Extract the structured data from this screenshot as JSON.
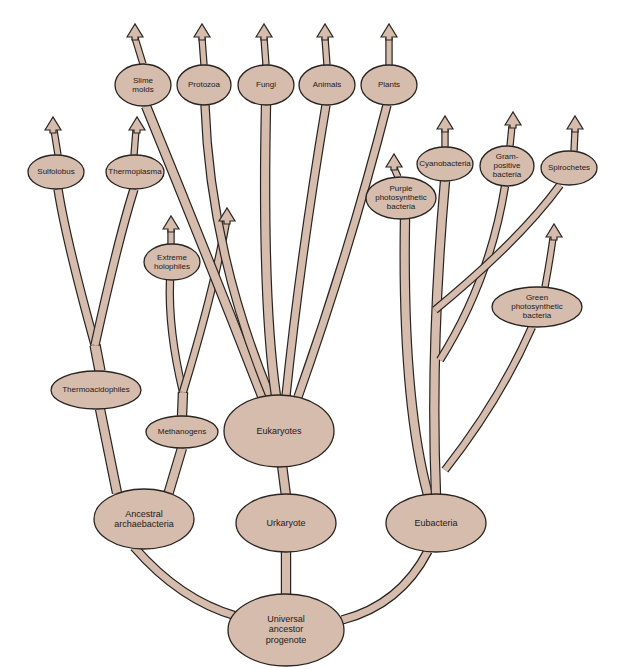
{
  "diagram": {
    "type": "phylogenetic-tree",
    "colors": {
      "fill": "#d6bcad",
      "stroke": "#2a2420",
      "background": "#ffffff"
    },
    "nodes": [
      {
        "id": "universal",
        "label": "Universal\nancestor\nprogenote",
        "x": 286,
        "y": 630,
        "rx": 58,
        "ry": 36,
        "fs": 9
      },
      {
        "id": "ancestral-archaebacteria",
        "label": "Ancestral\narchaebacteria",
        "x": 144,
        "y": 519,
        "rx": 50,
        "ry": 30,
        "fs": 9
      },
      {
        "id": "urkaryote",
        "label": "Urkaryote",
        "x": 286,
        "y": 523,
        "rx": 50,
        "ry": 29,
        "fs": 9
      },
      {
        "id": "eubacteria",
        "label": "Eubacteria",
        "x": 436,
        "y": 523,
        "rx": 50,
        "ry": 29,
        "fs": 9
      },
      {
        "id": "eukaryotes",
        "label": "Eukaryotes",
        "x": 279,
        "y": 431,
        "rx": 55,
        "ry": 36,
        "fs": 9
      },
      {
        "id": "methanogens",
        "label": "Methanogens",
        "x": 182,
        "y": 432,
        "rx": 36,
        "ry": 16,
        "fs": 8
      },
      {
        "id": "thermoacidophiles",
        "label": "Thermoacidophiles",
        "x": 96,
        "y": 390,
        "rx": 45,
        "ry": 19,
        "fs": 8
      },
      {
        "id": "extreme-halophiles",
        "label": "Extreme\nholophiles",
        "x": 172,
        "y": 262,
        "rx": 28,
        "ry": 18,
        "fs": 8
      },
      {
        "id": "sulfolobus",
        "label": "Sulfolobus",
        "x": 56,
        "y": 172,
        "rx": 28,
        "ry": 17,
        "fs": 8
      },
      {
        "id": "thermoplasma",
        "label": "Thermoplasma",
        "x": 135,
        "y": 172,
        "rx": 29,
        "ry": 17,
        "fs": 8
      },
      {
        "id": "slime-molds",
        "label": "Slime\nmolds",
        "x": 143,
        "y": 85,
        "rx": 28,
        "ry": 21,
        "fs": 8
      },
      {
        "id": "protozoa",
        "label": "Protozoa",
        "x": 204,
        "y": 85,
        "rx": 27,
        "ry": 20,
        "fs": 8
      },
      {
        "id": "fungi",
        "label": "Fungi",
        "x": 266,
        "y": 85,
        "rx": 28,
        "ry": 20,
        "fs": 8
      },
      {
        "id": "animals",
        "label": "Animals",
        "x": 327,
        "y": 85,
        "rx": 28,
        "ry": 20,
        "fs": 8
      },
      {
        "id": "plants",
        "label": "Plants",
        "x": 389,
        "y": 85,
        "rx": 28,
        "ry": 20,
        "fs": 8
      },
      {
        "id": "purple-photosynthetic",
        "label": "Purple\nphotosynthetic\nbacteria",
        "x": 401,
        "y": 198,
        "rx": 35,
        "ry": 21,
        "fs": 8
      },
      {
        "id": "cyanobacteria",
        "label": "Cyanobacteria",
        "x": 445,
        "y": 164,
        "rx": 28,
        "ry": 17,
        "fs": 8
      },
      {
        "id": "gram-positive",
        "label": "Gram-\npositive\nbacteria",
        "x": 507,
        "y": 166,
        "rx": 27,
        "ry": 20,
        "fs": 8
      },
      {
        "id": "spirochetes",
        "label": "Spirochetes",
        "x": 569,
        "y": 168,
        "rx": 28,
        "ry": 17,
        "fs": 8
      },
      {
        "id": "green-photosynthetic",
        "label": "Green\nphotosynthetic\nbacteria",
        "x": 537,
        "y": 307,
        "rx": 45,
        "ry": 20,
        "fs": 8
      }
    ],
    "edges": [
      {
        "from": "universal",
        "to": "ancestral-archaebacteria"
      },
      {
        "from": "universal",
        "to": "urkaryote"
      },
      {
        "from": "universal",
        "to": "eubacteria"
      },
      {
        "from": "urkaryote",
        "to": "eukaryotes"
      },
      {
        "from": "ancestral-archaebacteria",
        "to": "thermoacidophiles"
      },
      {
        "from": "ancestral-archaebacteria",
        "to": "methanogens"
      },
      {
        "from": "thermoacidophiles",
        "to": "sulfolobus"
      },
      {
        "from": "thermoacidophiles",
        "to": "thermoplasma"
      },
      {
        "from": "methanogens",
        "to": "extreme-halophiles"
      },
      {
        "from": "eukaryotes",
        "to": "slime-molds"
      },
      {
        "from": "eukaryotes",
        "to": "protozoa"
      },
      {
        "from": "eukaryotes",
        "to": "fungi"
      },
      {
        "from": "eukaryotes",
        "to": "animals"
      },
      {
        "from": "eukaryotes",
        "to": "plants"
      },
      {
        "from": "eubacteria",
        "to": "purple-photosynthetic"
      },
      {
        "from": "eubacteria",
        "to": "cyanobacteria"
      },
      {
        "from": "eubacteria",
        "to": "gram-positive"
      },
      {
        "from": "eubacteria",
        "to": "spirochetes"
      },
      {
        "from": "eubacteria",
        "to": "green-photosynthetic"
      }
    ]
  }
}
